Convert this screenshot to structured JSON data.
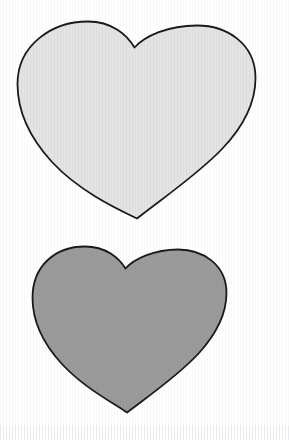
{
  "page": {
    "width": 289,
    "height": 440,
    "background_color": "#ffffff",
    "media": "scanned-line-art",
    "texture": "faint vertical scan striping"
  },
  "palette": {
    "background": "#ffffff",
    "outline": "#1a1a1a",
    "heart_light_fill": "#e3e3e3",
    "heart_dark_fill": "#9b9b9b"
  },
  "shapes": [
    {
      "id": "heart-top",
      "name": "heart-light",
      "label": "Light gray heart",
      "fill": "#e3e3e3",
      "stroke": "#1a1a1a",
      "stroke_width": 1.8,
      "bounds": {
        "x": 17,
        "y": 21,
        "width": 238,
        "height": 198
      },
      "notch": {
        "x": 134,
        "y": 47
      },
      "tip": {
        "x": 137,
        "y": 218
      },
      "left_lobe_peak": {
        "x": 74,
        "y": 22
      },
      "right_lobe_peak": {
        "x": 192,
        "y": 27
      },
      "path": "M134.5 47.5 C127 35 112 21.5 88 21.5 C52 21.5 17.5 45 17.5 84 C17.5 112 30 138 52 162 C78 190 113 207 137 218.5 C160 200 196 176 222 149 C245 125 255.5 101 255.5 78 C255.5 43 226 25.5 197 25.5 C168 25.5 145 36 134.5 47.5 Z"
    },
    {
      "id": "heart-bottom",
      "name": "heart-dark",
      "label": "Medium gray heart",
      "fill": "#9b9b9b",
      "stroke": "#1a1a1a",
      "stroke_width": 1.8,
      "bounds": {
        "x": 32,
        "y": 246,
        "width": 195,
        "height": 166
      },
      "notch": {
        "x": 125,
        "y": 268
      },
      "tip": {
        "x": 127,
        "y": 412
      },
      "left_lobe_peak": {
        "x": 78,
        "y": 247
      },
      "right_lobe_peak": {
        "x": 176,
        "y": 250
      },
      "path": "M125.5 268.5 C119 258 106 246.5 85 246.5 C55 246.5 32.5 266 32.5 298 C32.5 321 43 343 61 363 C83 387 110 401 127 412.5 C147 397 178 376 199 353 C218 332 226.5 312 226.5 293 C226.5 264 202 249.5 178 249.5 C154 249.5 134 259 125.5 268.5 Z"
    }
  ]
}
